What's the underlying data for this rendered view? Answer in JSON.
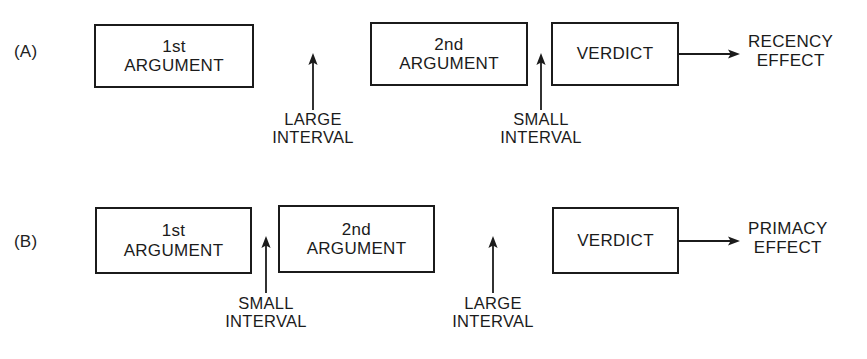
{
  "figure": {
    "background": "#ffffff",
    "stroke_color": "#1b1b1b",
    "width": 867,
    "height": 359
  },
  "panels": [
    {
      "id": "panel-a",
      "label": "(A)",
      "boxes": [
        {
          "id": "a-first-argument",
          "text": "1st\nARGUMENT"
        },
        {
          "id": "a-second-argument",
          "text": "2nd\nARGUMENT"
        },
        {
          "id": "a-verdict",
          "text": "VERDICT"
        }
      ],
      "intervals": [
        {
          "id": "a-large-interval",
          "text": "LARGE\nINTERVAL"
        },
        {
          "id": "a-small-interval",
          "text": "SMALL\nINTERVAL"
        }
      ],
      "outcome": {
        "id": "a-outcome",
        "text": "RECENCY\nEFFECT"
      }
    },
    {
      "id": "panel-b",
      "label": "(B)",
      "boxes": [
        {
          "id": "b-first-argument",
          "text": "1st\nARGUMENT"
        },
        {
          "id": "b-second-argument",
          "text": "2nd\nARGUMENT"
        },
        {
          "id": "b-verdict",
          "text": "VERDICT"
        }
      ],
      "intervals": [
        {
          "id": "b-small-interval",
          "text": "SMALL\nINTERVAL"
        },
        {
          "id": "b-large-interval",
          "text": "LARGE\nINTERVAL"
        }
      ],
      "outcome": {
        "id": "b-outcome",
        "text": "PRIMACY\nEFFECT"
      }
    }
  ]
}
